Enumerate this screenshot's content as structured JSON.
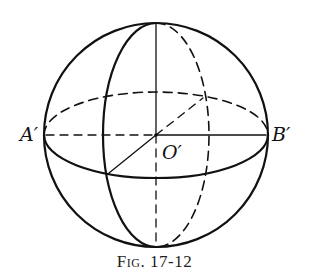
{
  "figure": {
    "caption": "Fig. 17-12",
    "labels": {
      "left_point": "A′",
      "right_point": "B′",
      "center": "O′"
    },
    "colors": {
      "stroke": "#111111",
      "background": "#ffffff"
    }
  },
  "geometry": {
    "sphere": {
      "cx": 156,
      "cy": 135,
      "r": 112
    },
    "equator_ellipse": {
      "rx": 112,
      "ry": 43,
      "front": "solid",
      "back": "dashed"
    },
    "meridian_ellipse": {
      "rx": 53,
      "ry": 112,
      "front": "solid-left",
      "back": "dashed-right"
    },
    "axes": {
      "horizontal": "dashed left of center, solid right of center",
      "vertical": "solid above center, dashed below center",
      "diagonal": "solid lower-left to center, dashed center to upper-right"
    }
  }
}
